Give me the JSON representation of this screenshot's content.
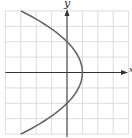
{
  "chart_data": {
    "type": "line",
    "title": "",
    "xlabel": "x",
    "ylabel": "y",
    "xlim": [
      -4,
      4
    ],
    "ylim": [
      -4,
      4
    ],
    "grid": true,
    "grid_step": 1,
    "legend": null,
    "series": [
      {
        "name": "parabola x = 1 - y^2/4",
        "points": [
          {
            "x": -3,
            "y": 4
          },
          {
            "x": -1.25,
            "y": 3
          },
          {
            "x": 0,
            "y": 2
          },
          {
            "x": 0.75,
            "y": 1
          },
          {
            "x": 1,
            "y": 0
          },
          {
            "x": 0.75,
            "y": -1
          },
          {
            "x": 0,
            "y": -2
          },
          {
            "x": -1.25,
            "y": -3
          },
          {
            "x": -3,
            "y": -4
          }
        ]
      }
    ]
  },
  "labels": {
    "x_axis": "x",
    "y_axis": "y"
  },
  "colors": {
    "grid": "#d4d4d4",
    "axis": "#333333",
    "curve": "#666666"
  }
}
